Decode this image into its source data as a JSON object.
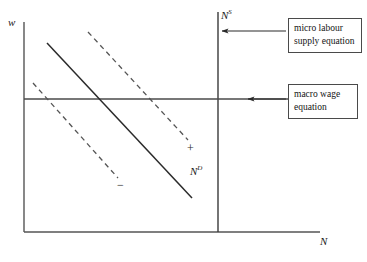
{
  "figure": {
    "background_color": "#ffffff",
    "line_color": "#2a2a2a",
    "axis_color": "#555555"
  },
  "axes": {
    "y_label": "w",
    "x_label": "N",
    "x_axis": {
      "x1": 24,
      "y1": 232,
      "x2": 320,
      "y2": 232
    },
    "y_axis": {
      "x1": 24,
      "y1": 22,
      "x2": 24,
      "y2": 232
    }
  },
  "curves": {
    "labour_supply": {
      "label_base": "N",
      "label_sup": "S",
      "style": "solid",
      "orientation": "vertical",
      "x1": 218,
      "y1": 12,
      "x2": 218,
      "y2": 232
    },
    "labour_demand": {
      "label_base": "N",
      "label_sup": "D",
      "style": "solid",
      "orientation": "downward-sloping",
      "x1": 47,
      "y1": 43,
      "x2": 192,
      "y2": 198
    },
    "macro_wage": {
      "style": "solid",
      "orientation": "horizontal",
      "x1": 24,
      "y1": 99,
      "x2": 288,
      "y2": 99
    },
    "shift_right": {
      "style": "dashed",
      "sign": "+",
      "x1": 88,
      "y1": 32,
      "x2": 188,
      "y2": 140
    },
    "shift_left": {
      "style": "dashed",
      "sign": "−",
      "x1": 33,
      "y1": 83,
      "x2": 118,
      "y2": 178
    }
  },
  "callouts": [
    {
      "id": "micro",
      "line1": "micro labour",
      "line2": "supply equation",
      "arrow_from_x": 286,
      "arrow_to_x": 222,
      "arrow_y": 31
    },
    {
      "id": "macro",
      "line1": "macro wage",
      "line2": "equation",
      "arrow_from_x": 286,
      "arrow_to_x": 248,
      "arrow_y": 99
    }
  ]
}
